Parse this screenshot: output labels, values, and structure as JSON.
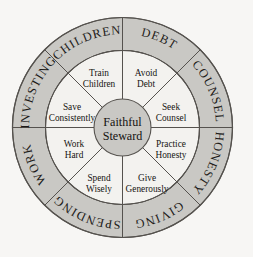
{
  "diagram": {
    "background_color": "#f7f6f4",
    "ring_fill_color": "#c9c8c4",
    "inner_fill_color": "#f3f2ef",
    "center_fill_color": "#c9c8c4",
    "stroke_color": "#55524e",
    "center": {
      "label_line1": "Faithful",
      "label_line2": "Steward"
    },
    "outer_ring": [
      {
        "id": "children",
        "label": "CHILDREN"
      },
      {
        "id": "debt",
        "label": "DEBT"
      },
      {
        "id": "counsel",
        "label": "COUNSEL"
      },
      {
        "id": "honesty",
        "label": "HONESTY"
      },
      {
        "id": "giving",
        "label": "GIVING"
      },
      {
        "id": "spending",
        "label": "SPENDING"
      },
      {
        "id": "work",
        "label": "WORK"
      },
      {
        "id": "investing",
        "label": "INVESTING"
      }
    ],
    "inner_sectors": [
      {
        "id": "train-children",
        "line1": "Train",
        "line2": "Children"
      },
      {
        "id": "avoid-debt",
        "line1": "Avoid",
        "line2": "Debt"
      },
      {
        "id": "seek-counsel",
        "line1": "Seek",
        "line2": "Counsel"
      },
      {
        "id": "practice-honesty",
        "line1": "Practice",
        "line2": "Honesty"
      },
      {
        "id": "give-generously",
        "line1": "Give",
        "line2": "Generously"
      },
      {
        "id": "spend-wisely",
        "line1": "Spend",
        "line2": "Wisely"
      },
      {
        "id": "work-hard",
        "line1": "Work",
        "line2": "Hard"
      },
      {
        "id": "save-consistently",
        "line1": "Save",
        "line2": "Consistently"
      }
    ]
  }
}
